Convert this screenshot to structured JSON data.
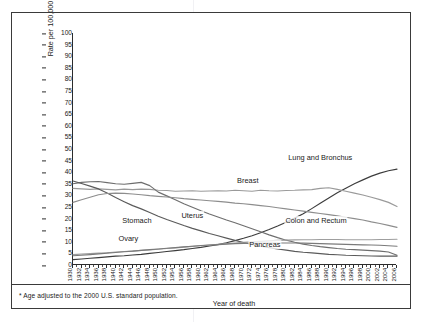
{
  "chart_data": {
    "type": "line",
    "title": "",
    "xlabel": "Year of death",
    "ylabel": "Rate per 100,000 females",
    "xlim": [
      1930,
      2006
    ],
    "ylim": [
      0,
      100
    ],
    "ytick_step": 5,
    "xtick_step": 2,
    "grid": false,
    "legend": "inline-annotations",
    "footnote": "* Age adjusted to the 2000 U.S. standard population.",
    "yticks": [
      0,
      5,
      10,
      15,
      20,
      25,
      30,
      35,
      40,
      45,
      50,
      55,
      60,
      65,
      70,
      75,
      80,
      85,
      90,
      95,
      100
    ],
    "xticks": [
      1930,
      1932,
      1934,
      1936,
      1938,
      1940,
      1942,
      1944,
      1946,
      1948,
      1950,
      1952,
      1954,
      1956,
      1958,
      1960,
      1962,
      1964,
      1966,
      1968,
      1970,
      1972,
      1974,
      1976,
      1978,
      1980,
      1982,
      1984,
      1986,
      1988,
      1990,
      1992,
      1994,
      1996,
      1998,
      2000,
      2002,
      2004,
      2006
    ],
    "x": [
      1930,
      1932,
      1934,
      1936,
      1938,
      1940,
      1942,
      1944,
      1946,
      1948,
      1950,
      1952,
      1954,
      1956,
      1958,
      1960,
      1962,
      1964,
      1966,
      1968,
      1970,
      1972,
      1974,
      1976,
      1978,
      1980,
      1982,
      1984,
      1986,
      1988,
      1990,
      1992,
      1994,
      1996,
      1998,
      2000,
      2002,
      2004,
      2006
    ],
    "series": [
      {
        "name": "Lung and Bronchus",
        "color": "#3c3c3c",
        "label_x": 1988,
        "label_y": 46,
        "values": [
          2.3,
          2.6,
          2.9,
          3.2,
          3.5,
          3.8,
          4.0,
          4.3,
          4.6,
          5.0,
          5.4,
          5.8,
          6.2,
          6.6,
          7.1,
          7.6,
          8.2,
          8.8,
          9.6,
          10.5,
          11.5,
          12.6,
          13.9,
          15.3,
          16.8,
          18.4,
          20.2,
          22.1,
          24.3,
          26.6,
          28.9,
          31.1,
          33.1,
          35.0,
          36.7,
          38.3,
          39.6,
          40.6,
          41.3
        ]
      },
      {
        "name": "Breast",
        "color": "#9a9a9a",
        "label_x": 1971,
        "label_y": 36,
        "values": [
          33.0,
          32.8,
          32.6,
          32.8,
          32.6,
          32.4,
          32.7,
          32.5,
          32.7,
          32.6,
          32.2,
          32.1,
          31.8,
          31.9,
          32.0,
          31.8,
          31.9,
          32.0,
          31.9,
          32.2,
          32.0,
          31.8,
          32.2,
          32.0,
          31.9,
          32.1,
          32.2,
          32.4,
          32.5,
          33.0,
          33.3,
          32.6,
          31.8,
          31.0,
          30.2,
          29.2,
          28.2,
          27.0,
          25.2
        ]
      },
      {
        "name": "Uterus",
        "color": "#6e6e6e",
        "label_x": 1958,
        "label_y": 21,
        "values": [
          35.0,
          35.6,
          35.9,
          36.0,
          35.5,
          35.0,
          34.8,
          35.2,
          35.6,
          34.2,
          31.4,
          29.8,
          28.1,
          26.4,
          24.9,
          23.4,
          22.0,
          20.7,
          19.4,
          18.2,
          16.9,
          15.6,
          14.3,
          13.0,
          11.8,
          10.7,
          9.8,
          9.0,
          8.4,
          7.9,
          7.5,
          7.1,
          6.8,
          6.6,
          6.4,
          6.2,
          6.0,
          5.6,
          4.2
        ]
      },
      {
        "name": "Stomach",
        "color": "#5a5a5a",
        "label_x": 1945,
        "label_y": 19,
        "values": [
          36.2,
          35.1,
          34.0,
          32.8,
          31.0,
          29.1,
          27.3,
          25.6,
          24.2,
          22.6,
          21.0,
          19.6,
          18.3,
          17.0,
          15.8,
          14.7,
          13.6,
          12.6,
          11.6,
          10.6,
          9.7,
          8.9,
          8.1,
          7.5,
          6.9,
          6.4,
          5.9,
          5.5,
          5.2,
          4.9,
          4.6,
          4.4,
          4.2,
          4.1,
          4.0,
          3.9,
          3.8,
          3.8,
          3.8
        ]
      },
      {
        "name": "Colon and Rectum",
        "color": "#8d8d8d",
        "label_x": 1987,
        "label_y": 19,
        "values": [
          27.0,
          28.1,
          29.2,
          30.3,
          30.8,
          31.0,
          30.9,
          30.6,
          30.3,
          29.9,
          29.6,
          29.3,
          29.0,
          28.6,
          28.3,
          28.0,
          27.7,
          27.4,
          27.1,
          26.7,
          26.4,
          26.0,
          25.6,
          25.2,
          24.7,
          24.2,
          23.7,
          23.2,
          22.7,
          22.2,
          21.7,
          21.2,
          20.6,
          20.0,
          19.4,
          18.6,
          17.9,
          17.1,
          16.2
        ]
      },
      {
        "name": "Pancreas",
        "color": "#9e9e9e",
        "label_x": 1975,
        "label_y": 8.6,
        "values": [
          4.5,
          4.7,
          4.9,
          5.1,
          5.3,
          5.6,
          5.8,
          6.0,
          6.3,
          6.5,
          6.8,
          7.1,
          7.4,
          7.7,
          8.0,
          8.3,
          8.6,
          8.9,
          9.2,
          9.5,
          9.8,
          10.0,
          10.2,
          10.4,
          10.6,
          10.7,
          10.8,
          10.9,
          10.9,
          11.0,
          11.0,
          11.0,
          10.9,
          10.9,
          10.9,
          10.9,
          11.0,
          11.0,
          11.1
        ]
      },
      {
        "name": "Ovary",
        "color": "#7a7a7a",
        "label_x": 1943,
        "label_y": 11.4,
        "values": [
          4.0,
          4.2,
          4.5,
          4.8,
          5.1,
          5.4,
          5.7,
          6.0,
          6.3,
          6.6,
          6.9,
          7.2,
          7.5,
          7.8,
          8.1,
          8.4,
          8.6,
          8.8,
          9.0,
          9.2,
          9.3,
          9.4,
          9.5,
          9.5,
          9.5,
          9.5,
          9.5,
          9.4,
          9.3,
          9.2,
          9.1,
          9.0,
          8.9,
          8.8,
          8.7,
          8.6,
          8.5,
          8.3,
          8.1
        ]
      }
    ]
  },
  "axis": {
    "y_title": "Rate per 100,000 females",
    "x_title": "Year of death"
  },
  "footnote": {
    "text": "* Age adjusted to the 2000 U.S. standard population."
  }
}
